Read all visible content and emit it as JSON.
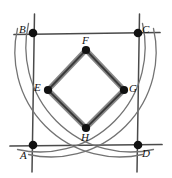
{
  "figure": {
    "canvas": {
      "width": 172,
      "height": 178,
      "background": "#ffffff"
    },
    "colors": {
      "square_line": "#3a3a3a",
      "arc_line": "#6b6b6b",
      "diamond_edge": "#6e6e6e",
      "diamond_edge_dark": "#2f2f2f",
      "vertex_fill": "#111111",
      "label_color": "#111111"
    },
    "square": {
      "name": "ABCD",
      "corners": [
        {
          "id": "A",
          "label": "A",
          "x": 33,
          "y": 145,
          "label_dx": -11,
          "label_dy": 4
        },
        {
          "id": "B",
          "label": "B",
          "x": 33,
          "y": 33,
          "label_dx": -12,
          "label_dy": -14
        },
        {
          "id": "C",
          "label": "C",
          "x": 138,
          "y": 33,
          "label_dx": 4,
          "label_dy": -14
        },
        {
          "id": "D",
          "label": "D",
          "x": 138,
          "y": 145,
          "label_dx": 4,
          "label_dy": 3
        }
      ],
      "side_length_px": 105,
      "extension_px": 16
    },
    "inner_quadrilateral": {
      "name": "EFGH",
      "vertices": [
        {
          "id": "F",
          "label": "F",
          "x": 86,
          "y": 50,
          "label_dx": -4,
          "label_dy": -16
        },
        {
          "id": "G",
          "label": "G",
          "x": 124,
          "y": 90,
          "label_dx": 5,
          "label_dy": -5
        },
        {
          "id": "H",
          "label": "H",
          "x": 86,
          "y": 128,
          "label_dx": -4,
          "label_dy": 5
        },
        {
          "id": "E",
          "label": "E",
          "x": 48,
          "y": 90,
          "label_dx": -13,
          "label_dy": -5
        }
      ],
      "edges": [
        {
          "from": "E",
          "to": "F"
        },
        {
          "from": "F",
          "to": "G"
        },
        {
          "from": "G",
          "to": "H"
        },
        {
          "from": "H",
          "to": "E"
        }
      ],
      "edge_width_px": 5,
      "fill": "none"
    },
    "arcs": [
      {
        "id": "arc-A",
        "center": "A",
        "radius": 105,
        "from": {
          "x": 33,
          "y": 40
        },
        "to": {
          "x": 138,
          "y": 145
        },
        "note": "quarter circle centered at A"
      },
      {
        "id": "arc-B",
        "center": "B",
        "radius": 105,
        "from": {
          "x": 33,
          "y": 138
        },
        "to": {
          "x": 138,
          "y": 33
        },
        "note": "quarter circle centered at B"
      },
      {
        "id": "arc-C",
        "center": "C",
        "radius": 105,
        "from": {
          "x": 33,
          "y": 33
        },
        "to": {
          "x": 138,
          "y": 138
        },
        "note": "quarter circle centered at C"
      },
      {
        "id": "arc-D",
        "center": "D",
        "radius": 105,
        "from": {
          "x": 33,
          "y": 145
        },
        "to": {
          "x": 138,
          "y": 40
        },
        "note": "quarter circle centered at D"
      }
    ],
    "vertex_dot_radius_px": 4.2,
    "labels": {
      "A": "A",
      "B": "B",
      "C": "C",
      "D": "D",
      "E": "E",
      "F": "F",
      "G": "G",
      "H": "H"
    }
  }
}
